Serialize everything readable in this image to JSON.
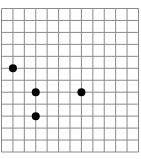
{
  "diagram": {
    "type": "dot-grid",
    "grid": {
      "columns": 12,
      "rows": 12,
      "line_color": "#8a8a8a",
      "background": "#ffffff"
    },
    "dot_color": "#000000",
    "points": [
      {
        "id": "A",
        "col": 1,
        "row": 5
      },
      {
        "id": "B",
        "col": 3,
        "row": 7
      },
      {
        "id": "C",
        "col": 7,
        "row": 7
      },
      {
        "id": "D",
        "col": 3,
        "row": 9
      }
    ]
  }
}
